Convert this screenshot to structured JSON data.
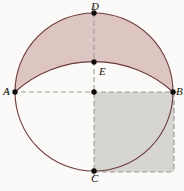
{
  "figure": {
    "canvas": {
      "width": 184,
      "height": 191,
      "background_color": "#fbfaf8"
    },
    "colors": {
      "curve_stroke": "#6b3a3a",
      "lune_fill": "#ddc5c2",
      "square_fill": "#d6d5d1",
      "square_dash_stroke": "#9b9a96",
      "axis_dash_stroke": "#9b9a96",
      "point_fill": "#100d0a",
      "label_color": "#16130f",
      "caption_color": "#cfcbc6"
    },
    "circle": {
      "center_x": 94,
      "center_y": 92,
      "radius": 79,
      "stroke_width": 1.1
    },
    "lune_arc": {
      "description": "flatter arc from A through E to B",
      "from": "A",
      "via": "E",
      "to": "B",
      "sagitta": 30
    },
    "square": {
      "description": "shaded square with corners at circle center, B, bottom-right, and C level",
      "left": 94,
      "top": 92,
      "right": 174,
      "bottom": 172,
      "side": 80
    },
    "points": [
      {
        "id": "D",
        "label": "D",
        "x": 94,
        "y": 13,
        "label_x": 91,
        "label_y": 1,
        "on": "circle-top"
      },
      {
        "id": "E",
        "label": "E",
        "x": 94,
        "y": 62,
        "label_x": 99,
        "label_y": 66,
        "on": "lune-arc-apex"
      },
      {
        "id": "A",
        "label": "A",
        "x": 15,
        "y": 92,
        "label_x": 3,
        "label_y": 86,
        "on": "circle-left"
      },
      {
        "id": "B",
        "label": "B",
        "x": 173,
        "y": 92,
        "label_x": 176,
        "label_y": 86,
        "on": "circle-right"
      },
      {
        "id": "C",
        "label": "C",
        "x": 94,
        "y": 171,
        "label_x": 91,
        "label_y": 173,
        "on": "circle-bottom"
      },
      {
        "id": "O",
        "label": "",
        "x": 94,
        "y": 92,
        "label_x": 0,
        "label_y": 0,
        "on": "circle-center"
      }
    ],
    "dashed_lines": [
      {
        "id": "horizontal-diameter",
        "x1": 5,
        "y1": 92,
        "x2": 180,
        "y2": 92
      },
      {
        "id": "vertical-diameter",
        "x1": 94,
        "y1": 5,
        "x2": 94,
        "y2": 182
      },
      {
        "id": "square-right-edge",
        "x1": 174,
        "y1": 92,
        "x2": 174,
        "y2": 172
      },
      {
        "id": "square-bottom-edge",
        "x1": 94,
        "y1": 172,
        "x2": 174,
        "y2": 172
      }
    ],
    "caption_fragments": [
      {
        "text": "",
        "x": 6,
        "y": 184,
        "width": 26
      },
      {
        "text": "",
        "x": 44,
        "y": 184,
        "width": 22
      }
    ]
  }
}
